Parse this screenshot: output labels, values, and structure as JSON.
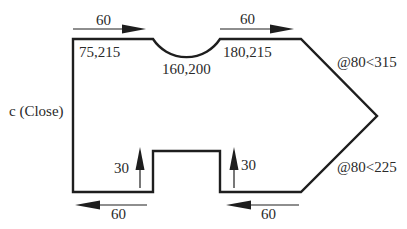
{
  "diagram": {
    "type": "cad-polyline-drawing",
    "colors": {
      "line": "#1e1e1e",
      "text": "#2a2a2a",
      "background": "#ffffff"
    },
    "labels": {
      "close": "c (Close)",
      "point_start": "75,215",
      "point_arc_mid": "160,200",
      "point_arc_end": "180,215",
      "polar_upper": "@80<315",
      "polar_lower": "@80<225",
      "dim_top_left": "60",
      "dim_top_right": "60",
      "dim_bottom_left": "60",
      "dim_bottom_right": "60",
      "dim_notch_left": "30",
      "dim_notch_right": "30"
    },
    "shape": {
      "outline_points": [
        [
          73,
          39
        ],
        [
          153,
          39
        ],
        [
          220,
          39
        ],
        [
          301,
          39
        ],
        [
          377,
          116
        ],
        [
          301,
          192
        ],
        [
          220,
          192
        ],
        [
          220,
          151
        ],
        [
          153,
          151
        ],
        [
          153,
          192
        ],
        [
          73,
          192
        ]
      ],
      "arc": {
        "from": [
          153,
          39
        ],
        "to": [
          220,
          39
        ],
        "depth": 18
      }
    },
    "arrows": [
      {
        "name": "arrow-top-left",
        "direction": "right"
      },
      {
        "name": "arrow-top-right",
        "direction": "right"
      },
      {
        "name": "arrow-bottom-left",
        "direction": "left"
      },
      {
        "name": "arrow-bottom-right",
        "direction": "left"
      },
      {
        "name": "arrow-notch-left",
        "direction": "up"
      },
      {
        "name": "arrow-notch-right",
        "direction": "up"
      }
    ]
  }
}
